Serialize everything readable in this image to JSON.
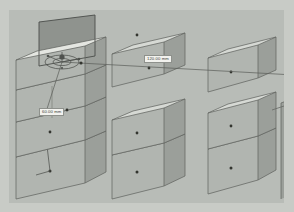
{
  "app": {
    "view_name": "3D Viewport",
    "projection": "isometric"
  },
  "colors": {
    "background": "#b8bcb7",
    "frame": "#c8cbc6",
    "face_top": "#d5d8d3",
    "face_front": "#b0b4af",
    "face_side": "#9a9e99",
    "edge": "#636662",
    "selected_top": "#8f938e",
    "selected_outline": "#4c4f4b",
    "gizmo": "#555854",
    "marker": "#33352f",
    "dim_line": "#5a5d59",
    "label_bg": "#f2f2ee",
    "label_text": "#3a3c39"
  },
  "dimensions": {
    "main_label": "120.00 mm",
    "secondary_label": "60.00 mm"
  },
  "gizmo": {
    "name": "transform-gizmo",
    "center_label": "",
    "handle_count": 3
  },
  "scene": {
    "column_count": 3,
    "partial_column": true,
    "columns": [
      {
        "id": "column-left",
        "selected_index": 0,
        "boxes": [
          {
            "id": "box-left-1",
            "selected": true,
            "marker": true
          },
          {
            "id": "box-left-2",
            "selected": false,
            "marker": true
          },
          {
            "id": "box-left-3",
            "selected": false,
            "marker": true
          },
          {
            "id": "box-left-4",
            "selected": false,
            "marker": true
          }
        ]
      },
      {
        "id": "column-middle",
        "selected_index": -1,
        "boxes": [
          {
            "id": "box-mid-1",
            "selected": false,
            "marker": true
          },
          {
            "id": "box-mid-2",
            "selected": false,
            "marker": true
          },
          {
            "id": "box-mid-3",
            "selected": false,
            "marker": true
          }
        ]
      },
      {
        "id": "column-right",
        "selected_index": -1,
        "boxes": [
          {
            "id": "box-right-1",
            "selected": false,
            "marker": true
          },
          {
            "id": "box-right-2",
            "selected": false,
            "marker": true
          },
          {
            "id": "box-right-3",
            "selected": false,
            "marker": true
          }
        ]
      }
    ]
  }
}
